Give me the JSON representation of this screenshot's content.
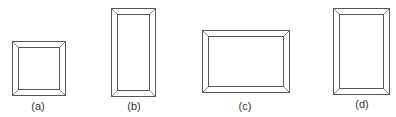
{
  "figure": {
    "colors": {
      "line": "#555555",
      "background": "#ffffff",
      "label": "#333333"
    },
    "frames": [
      {
        "id": "a",
        "label": "(a)",
        "shape": "square",
        "x": 12,
        "y": 41,
        "w": 53,
        "h": 54,
        "border": 6
      },
      {
        "id": "b",
        "label": "(b)",
        "shape": "tall rectangle",
        "x": 111,
        "y": 8,
        "w": 44,
        "h": 88,
        "border": 6
      },
      {
        "id": "c",
        "label": "(c)",
        "shape": "wide rectangle",
        "x": 202,
        "y": 30,
        "w": 87,
        "h": 62,
        "border": 6
      },
      {
        "id": "d",
        "label": "(d)",
        "shape": "tall rectangle",
        "x": 333,
        "y": 8,
        "w": 56,
        "h": 86,
        "border": 6
      }
    ]
  }
}
